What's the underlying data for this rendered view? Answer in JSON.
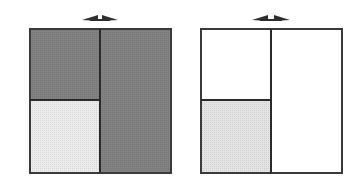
{
  "diagram": {
    "type": "square-partition-comparison",
    "colors": {
      "border": "#3a3a3a",
      "dark_fill": "#7f7f7f",
      "light_fill": "#e6e6e6",
      "white_fill": "#ffffff",
      "arrow": "#2e2e2e"
    },
    "panels": [
      {
        "id": "left",
        "regions": [
          {
            "name": "top-left",
            "fill": "dark"
          },
          {
            "name": "bottom-left",
            "fill": "light"
          },
          {
            "name": "right",
            "fill": "dark"
          }
        ],
        "arrow": "double-headed-horizontal"
      },
      {
        "id": "right",
        "regions": [
          {
            "name": "top-left",
            "fill": "white"
          },
          {
            "name": "bottom-left",
            "fill": "light"
          },
          {
            "name": "right",
            "fill": "white"
          }
        ],
        "arrow": "double-headed-horizontal"
      }
    ]
  }
}
